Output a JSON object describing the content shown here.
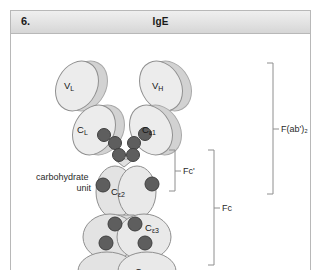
{
  "figure": {
    "number": "6.",
    "title": "IgE",
    "caption_alt": "Schematic of an IgE antibody molecule showing light and heavy chain domains, carbohydrate units and proteolytic fragments."
  },
  "colors": {
    "card_border": "#b8b8b8",
    "header_band": "#e2e2e2",
    "domain_fill": "#e6e6e6",
    "domain_shadow": "#d2d2d2",
    "domain_stroke": "#9a9a9a",
    "carb_dot_fill": "#5e5e5e",
    "carb_dot_stroke": "#3f3f3f",
    "bracket_stroke": "#8e8e8e",
    "text": "#1a1a1a"
  },
  "domains": [
    {
      "id": "vl",
      "label": "V",
      "sub": "L",
      "name": "domain-vl",
      "chain": "light",
      "x": 61,
      "y": 47
    },
    {
      "id": "cl",
      "label": "C",
      "sub": "L",
      "name": "domain-cl",
      "chain": "light",
      "x": 72,
      "y": 89
    },
    {
      "id": "vh",
      "label": "V",
      "sub": "H",
      "name": "domain-vh",
      "chain": "heavy",
      "x": 155,
      "y": 46
    },
    {
      "id": "ce1",
      "label": "C",
      "sub": "ε1",
      "name": "domain-ce1",
      "chain": "heavy",
      "x": 141,
      "y": 90
    },
    {
      "id": "ce2",
      "label": "C",
      "sub": "ε2",
      "name": "domain-ce2",
      "chain": "heavy",
      "x": 110,
      "y": 157
    },
    {
      "id": "ce3",
      "label": "C",
      "sub": "ε3",
      "name": "domain-ce3",
      "chain": "heavy",
      "x": 128,
      "y": 198
    },
    {
      "id": "ce4",
      "label": "C",
      "sub": "ε4",
      "name": "domain-ce4",
      "chain": "heavy",
      "x": 128,
      "y": 240
    }
  ],
  "annotations": [
    {
      "id": "carbohydrate",
      "line1": "carbohydrate",
      "line2": "unit",
      "name": "carbohydrate-unit-label"
    }
  ],
  "brackets": [
    {
      "id": "fab2",
      "label": "F(ab')₂",
      "name": "bracket-fab2",
      "x": 262,
      "top": 52,
      "bottom": 183,
      "label_x": 272,
      "label_y": 120
    },
    {
      "id": "fc",
      "label": "Fc",
      "name": "bracket-fc",
      "x": 203,
      "top": 139,
      "bottom": 254,
      "label_x": 212,
      "label_y": 198
    },
    {
      "id": "fcp",
      "label": "Fc'",
      "name": "bracket-fcprime",
      "x": 164,
      "top": 139,
      "bottom": 180,
      "label_x": 173,
      "label_y": 161
    }
  ],
  "carbohydrate_dots": [
    {
      "name": "carb-dot-hinge-l1",
      "cx": 93,
      "cy": 101,
      "r": 6.5
    },
    {
      "name": "carb-dot-hinge-l2",
      "cx": 104,
      "cy": 109,
      "r": 6.5
    },
    {
      "name": "carb-dot-hinge-l3",
      "cx": 108,
      "cy": 121,
      "r": 6.5
    },
    {
      "name": "carb-dot-hinge-r1",
      "cx": 134,
      "cy": 100,
      "r": 6.5
    },
    {
      "name": "carb-dot-hinge-r2",
      "cx": 123,
      "cy": 109,
      "r": 6.5
    },
    {
      "name": "carb-dot-hinge-r3",
      "cx": 122,
      "cy": 121,
      "r": 6.5
    },
    {
      "name": "carb-dot-ce2-left",
      "cx": 92,
      "cy": 151,
      "r": 7
    },
    {
      "name": "carb-dot-ce2-right",
      "cx": 141,
      "cy": 150,
      "r": 7
    },
    {
      "name": "carb-dot-ce3-tl",
      "cx": 104,
      "cy": 190,
      "r": 7
    },
    {
      "name": "carb-dot-ce3-tr",
      "cx": 124,
      "cy": 190,
      "r": 7
    },
    {
      "name": "carb-dot-ce3-bl",
      "cx": 95,
      "cy": 209,
      "r": 7
    },
    {
      "name": "carb-dot-ce3-br",
      "cx": 134,
      "cy": 209,
      "r": 7
    }
  ]
}
